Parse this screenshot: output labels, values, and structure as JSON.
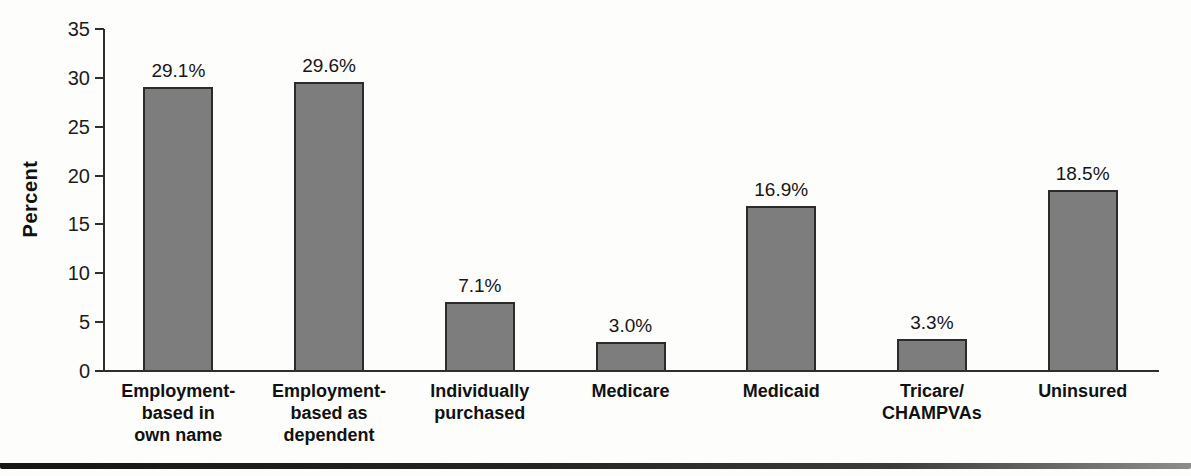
{
  "chart_data": {
    "type": "bar",
    "title": "",
    "ylabel": "Percent",
    "xlabel": "",
    "ylim": [
      0,
      35
    ],
    "yticks": [
      0,
      5,
      10,
      15,
      20,
      25,
      30,
      35
    ],
    "grid": false,
    "legend": false,
    "categories": [
      "Employment-\nbased in\nown name",
      "Employment-\nbased as\ndependent",
      "Individually\npurchased",
      "Medicare",
      "Medicaid",
      "Tricare/\nCHAMPVAs",
      "Uninsured"
    ],
    "values": [
      29.1,
      29.6,
      7.1,
      3.0,
      16.9,
      3.3,
      18.5
    ],
    "value_labels": [
      "29.1%",
      "29.6%",
      "7.1%",
      "3.0%",
      "16.9%",
      "3.3%",
      "18.5%"
    ],
    "colors": {
      "bar_fill": "#7d7d7d",
      "bar_border": "#2b2b2b",
      "axis": "#2e2e2e",
      "text": "#1a1a1a",
      "background": "#fdfdfb"
    }
  }
}
